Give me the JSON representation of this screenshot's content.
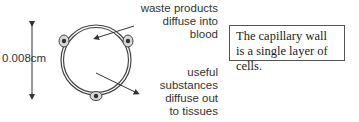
{
  "diagram": {
    "measurement_label": "0.008cm",
    "labels": {
      "waste": "waste products diffuse into blood",
      "useful": "useful substances diffuse out to tissues"
    },
    "waste_lines": [
      "waste products",
      "diffuse into",
      "blood"
    ],
    "useful_lines": [
      "useful",
      "substances",
      "diffuse out",
      "to tissues"
    ]
  },
  "note": {
    "text": "The capillary wall is a single layer of cells."
  }
}
